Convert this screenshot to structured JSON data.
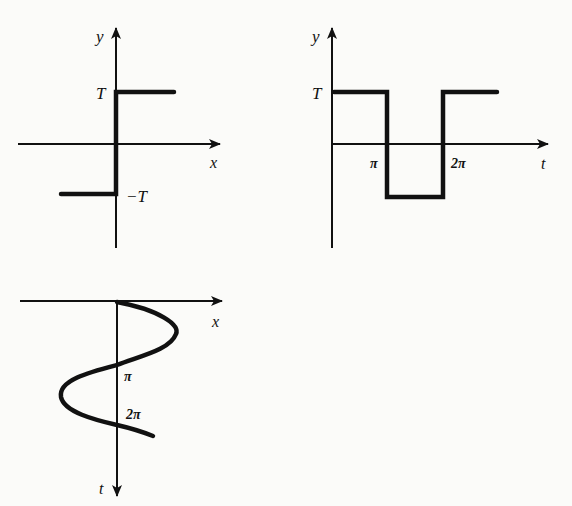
{
  "diagrams": [
    {
      "id": "step-function",
      "axes": {
        "horizontal": "x",
        "vertical": "y"
      },
      "labels": {
        "upper": "T",
        "lower": "−T",
        "x_axis": "x",
        "y_axis": "y"
      }
    },
    {
      "id": "square-wave",
      "axes": {
        "horizontal": "t",
        "vertical": "y"
      },
      "labels": {
        "upper": "T",
        "x_axis": "t",
        "y_axis": "y",
        "tick_pi": "π",
        "tick_2pi": "2π"
      }
    },
    {
      "id": "sine-trajectory",
      "axes": {
        "horizontal": "x",
        "vertical": "t"
      },
      "labels": {
        "x_axis": "x",
        "t_axis": "t",
        "tick_pi": "π",
        "tick_2pi": "2π"
      }
    }
  ],
  "colors": {
    "ink": "#111111",
    "background": "#fbfbf9"
  }
}
